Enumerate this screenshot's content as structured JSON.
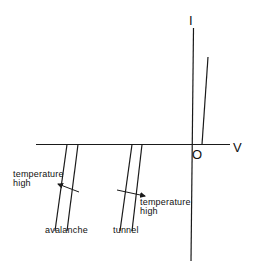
{
  "diagram": {
    "type": "I-V characteristic (reverse breakdown temperature dependence)",
    "axes": {
      "y_label": "I",
      "x_label": "V",
      "origin_label": "O"
    },
    "curves": {
      "forward": {
        "label": ""
      },
      "avalanche": {
        "label": "avalanche",
        "temperature_note_line1": "temperature",
        "temperature_note_line2": "high",
        "temperature_direction": "left (breakdown voltage increases with temperature)"
      },
      "tunnel": {
        "label": "tunnel",
        "temperature_note_line1": "temperature",
        "temperature_note_line2": "high",
        "temperature_direction": "right (breakdown voltage decreases with temperature)"
      }
    },
    "colors": {
      "line": "#1a1a1a",
      "background": "#ffffff"
    }
  }
}
